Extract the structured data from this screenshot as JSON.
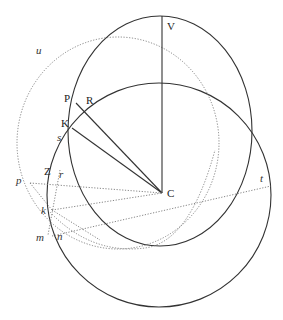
{
  "diagram": {
    "type": "geometric-construction",
    "colors": {
      "solid": "#333333",
      "dotted": "#777777",
      "background": "#ffffff"
    },
    "center": {
      "label": "C",
      "x": 162,
      "y": 193
    },
    "solid_circles": [
      {
        "name": "upper-circle",
        "cx": 160,
        "cy": 131,
        "rx": 92,
        "ry": 115
      },
      {
        "name": "lower-circle",
        "cx": 159,
        "cy": 195,
        "rx": 112,
        "ry": 112
      }
    ],
    "dotted_circles": [
      {
        "name": "circle-u",
        "cx": 118,
        "cy": 143,
        "rx": 101,
        "ry": 106
      },
      {
        "name": "circle-k",
        "cx": 145,
        "cy": 170,
        "rx": 100,
        "ry": 78
      }
    ],
    "points": {
      "V": {
        "label": "V",
        "x": 162,
        "y": 16
      },
      "P": {
        "label": "P",
        "x": 76,
        "y": 98
      },
      "R": {
        "label": "R",
        "x": 86,
        "y": 109
      },
      "K": {
        "label": "K",
        "x": 72,
        "y": 123
      },
      "s": {
        "label": "s",
        "x": 61,
        "y": 138
      },
      "u": {
        "label": "u",
        "x": 38,
        "y": 51
      },
      "Z": {
        "label": "Z",
        "x": 49,
        "y": 178
      },
      "r": {
        "label": "r",
        "x": 58,
        "y": 183
      },
      "p": {
        "label": "p",
        "x": 20,
        "y": 181
      },
      "k": {
        "label": "k",
        "x": 48,
        "y": 210
      },
      "m": {
        "label": "m",
        "x": 47,
        "y": 237
      },
      "n": {
        "label": "n",
        "x": 57,
        "y": 236
      },
      "t": {
        "label": "t",
        "x": 270,
        "y": 185
      }
    }
  }
}
